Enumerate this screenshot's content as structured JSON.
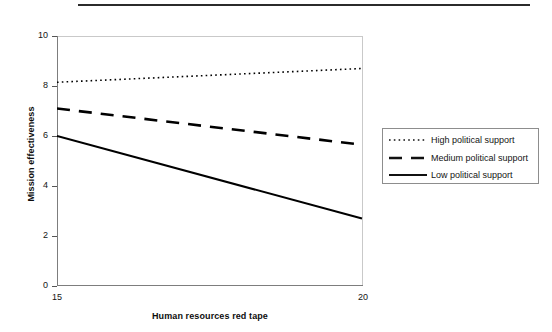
{
  "figure": {
    "top_rule": "horizontal-rule",
    "background_color": "#ffffff",
    "line_color": "#000000"
  },
  "axes": {
    "y_title": "Mission effectiveness",
    "x_title": "Human resources red tape",
    "y_ticks": [
      "10",
      "8",
      "6",
      "4",
      "2",
      "0"
    ],
    "x_ticks": [
      "15",
      "20"
    ]
  },
  "legend": {
    "items": [
      {
        "label": "High political support",
        "style": "dotted",
        "swatch": "dotted-line-swatch"
      },
      {
        "label": "Medium political support",
        "style": "dashed",
        "swatch": "dashed-line-swatch"
      },
      {
        "label": "Low political support",
        "style": "solid",
        "swatch": "solid-line-swatch"
      }
    ]
  },
  "chart_data": {
    "type": "line",
    "title": "",
    "xlabel": "Human resources red tape",
    "ylabel": "Mission effectiveness",
    "xlim": [
      15,
      20
    ],
    "ylim": [
      0,
      10
    ],
    "xticks": [
      15,
      20
    ],
    "yticks": [
      0,
      2,
      4,
      6,
      8,
      10
    ],
    "grid": false,
    "legend_position": "right",
    "x": [
      15,
      20
    ],
    "series": [
      {
        "name": "High political support",
        "style": "dotted",
        "color": "#000000",
        "values": [
          8.15,
          8.7
        ]
      },
      {
        "name": "Medium political support",
        "style": "dashed",
        "color": "#000000",
        "values": [
          7.1,
          5.65
        ]
      },
      {
        "name": "Low political support",
        "style": "solid",
        "color": "#000000",
        "values": [
          6.0,
          2.7
        ]
      }
    ]
  }
}
